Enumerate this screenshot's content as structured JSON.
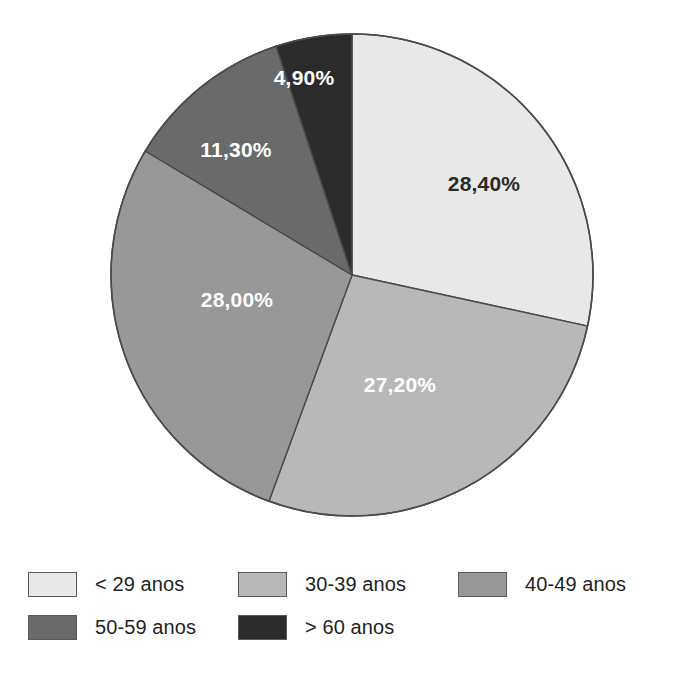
{
  "chart_data": {
    "type": "pie",
    "title": "",
    "subtitle": "",
    "xlabel": "",
    "ylabel": "",
    "legend_position": "bottom",
    "grid": false,
    "start_angle_deg": 0,
    "direction": "clockwise",
    "categories": [
      "< 29 anos",
      "30-39 anos",
      "40-49 anos",
      "50-59 anos",
      "> 60 anos"
    ],
    "values": [
      28.4,
      27.2,
      28.0,
      11.3,
      4.9
    ],
    "value_labels": [
      "28,40%",
      "27,20%",
      "28,00%",
      "11,30%",
      "4,90%"
    ],
    "colors": [
      "#e8e8e8",
      "#b8b8b8",
      "#989898",
      "#6a6a6a",
      "#2b2b2b"
    ],
    "label_text_colors": [
      "#2a2a2a",
      "#ffffff",
      "#ffffff",
      "#ffffff",
      "#ffffff"
    ],
    "slices": [
      {
        "label": "< 29 anos",
        "value": 28.4,
        "value_label": "28,40%",
        "color": "#e8e8e8",
        "label_color": "dark",
        "start_deg": 0.0,
        "end_deg": 102.24,
        "label_x": 484,
        "label_y": 184
      },
      {
        "label": "30-39 anos",
        "value": 27.2,
        "value_label": "27,20%",
        "color": "#b8b8b8",
        "label_color": "light",
        "start_deg": 102.24,
        "end_deg": 200.16,
        "label_x": 400,
        "label_y": 385
      },
      {
        "label": "40-49 anos",
        "value": 28.0,
        "value_label": "28,00%",
        "color": "#989898",
        "label_color": "light",
        "start_deg": 200.16,
        "end_deg": 300.96,
        "label_x": 237,
        "label_y": 300
      },
      {
        "label": "50-59 anos",
        "value": 11.3,
        "value_label": "11,30%",
        "color": "#6a6a6a",
        "label_color": "light",
        "start_deg": 300.96,
        "end_deg": 341.64,
        "label_x": 236,
        "label_y": 150
      },
      {
        "label": "> 60 anos",
        "value": 4.9,
        "value_label": "4,90%",
        "color": "#2b2b2b",
        "label_color": "light",
        "start_deg": 341.64,
        "end_deg": 359.99,
        "label_x": 304,
        "label_y": 78
      }
    ],
    "geometry": {
      "center_x": 352,
      "center_y": 275,
      "radius": 241,
      "outline_color": "#4a4a4a"
    }
  },
  "legend": {
    "rows": [
      [
        {
          "label": "< 29 anos",
          "color": "#e8e8e8"
        },
        {
          "label": "30-39 anos",
          "color": "#b8b8b8"
        },
        {
          "label": "40-49 anos",
          "color": "#989898"
        }
      ],
      [
        {
          "label": "50-59 anos",
          "color": "#6a6a6a"
        },
        {
          "label": "> 60 anos",
          "color": "#2b2b2b"
        }
      ]
    ]
  }
}
